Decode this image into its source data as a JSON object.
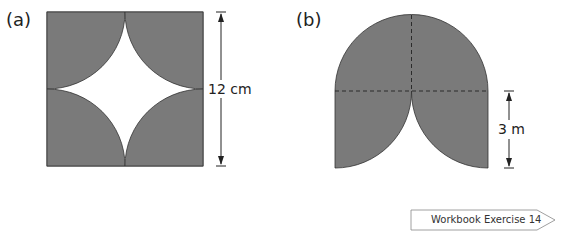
{
  "figures": {
    "a": {
      "label": "(a)",
      "dimension": "12 cm",
      "shape": "square with four shaded quarter circles at corners, unshaded curved-star center",
      "fill_color": "#7a7a7a"
    },
    "b": {
      "label": "(b)",
      "dimension": "3 m",
      "shape": "semicircle on top of two quarter-circle lobes, dashed construction lines",
      "fill_color": "#7a7a7a"
    }
  },
  "footer": {
    "workbook_label": "Workbook Exercise 14"
  }
}
